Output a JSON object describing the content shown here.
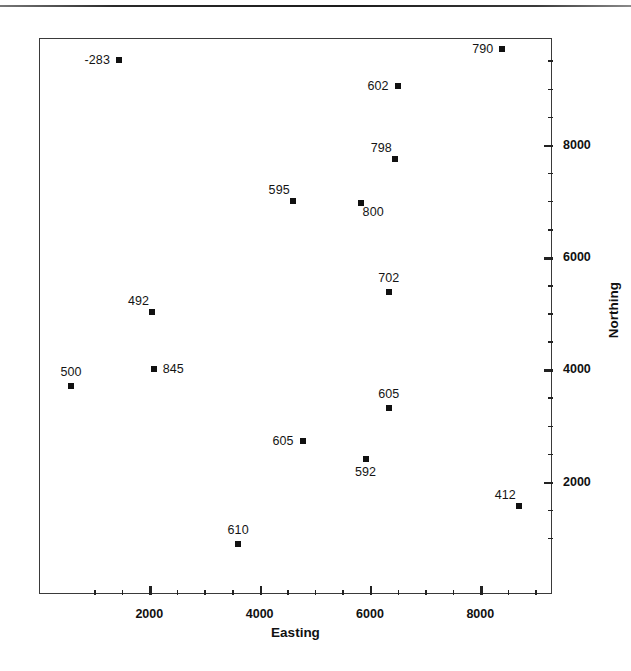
{
  "chart_data": {
    "type": "scatter",
    "title": "",
    "xlabel": "Easting",
    "ylabel": "Northing",
    "xlim": [
      0,
      9300
    ],
    "ylim": [
      0,
      9900
    ],
    "grid": false,
    "legend": null,
    "x_ticks_major": [
      2000,
      4000,
      6000,
      8000
    ],
    "x_tick_labels": [
      "2000",
      "4000",
      "6000",
      "8000"
    ],
    "x_ticks_minor": [
      1000,
      1500,
      2500,
      3000,
      3500,
      4500,
      5000,
      5500,
      6500,
      7000,
      7500,
      8500,
      9000
    ],
    "y_ticks_major": [
      2000,
      4000,
      6000,
      8000
    ],
    "y_tick_labels": [
      "2000",
      "4000",
      "6000",
      "8000"
    ],
    "y_ticks_minor": [
      1000,
      1500,
      2500,
      3000,
      3500,
      4500,
      5000,
      5500,
      6500,
      7000,
      7500,
      8500,
      9000,
      9500
    ],
    "marker": "filled-square",
    "marker_color": "#111111",
    "points": [
      {
        "label": "-283",
        "x": 1450,
        "y": 9500,
        "label_pos": "left"
      },
      {
        "label": "790",
        "x": 8400,
        "y": 9700,
        "label_pos": "left"
      },
      {
        "label": "602",
        "x": 6500,
        "y": 9050,
        "label_pos": "left"
      },
      {
        "label": "798",
        "x": 6450,
        "y": 7750,
        "label_pos": "above-left"
      },
      {
        "label": "595",
        "x": 4600,
        "y": 7000,
        "label_pos": "above-left"
      },
      {
        "label": "800",
        "x": 5830,
        "y": 6960,
        "label_pos": "below-right"
      },
      {
        "label": "702",
        "x": 6340,
        "y": 5380,
        "label_pos": "above"
      },
      {
        "label": "492",
        "x": 2050,
        "y": 5030,
        "label_pos": "above-left"
      },
      {
        "label": "845",
        "x": 2080,
        "y": 4000,
        "label_pos": "right"
      },
      {
        "label": "500",
        "x": 580,
        "y": 3700,
        "label_pos": "above"
      },
      {
        "label": "605",
        "x": 6340,
        "y": 3310,
        "label_pos": "above"
      },
      {
        "label": "605",
        "x": 4780,
        "y": 2730,
        "label_pos": "left"
      },
      {
        "label": "592",
        "x": 5920,
        "y": 2400,
        "label_pos": "below"
      },
      {
        "label": "412",
        "x": 8700,
        "y": 1570,
        "label_pos": "above-left"
      },
      {
        "label": "610",
        "x": 3610,
        "y": 890,
        "label_pos": "above"
      }
    ]
  },
  "axes": {
    "x_title": "Easting",
    "y_title": "Northing"
  },
  "colors": {
    "marker": "#111111",
    "frame": "#3a3a3a",
    "text": "#111111",
    "background": "#ffffff"
  }
}
